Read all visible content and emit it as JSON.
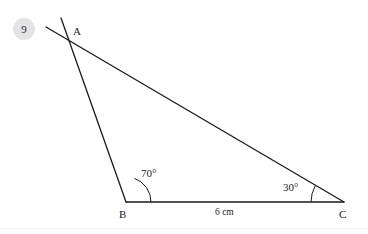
{
  "question": {
    "number": "9"
  },
  "figure": {
    "type": "triangle-geometry-diagram",
    "vertices": [
      {
        "name": "A",
        "label": "A",
        "x": 68,
        "y": 38
      },
      {
        "name": "B",
        "label": "B",
        "x": 126,
        "y": 202
      },
      {
        "name": "C",
        "label": "C",
        "x": 344,
        "y": 202
      }
    ],
    "angles": [
      {
        "at": "B",
        "label": "70°",
        "value": 70,
        "arc_radius": 25
      },
      {
        "at": "C",
        "label": "30°",
        "value": 30,
        "arc_radius": 33
      }
    ],
    "sides": [
      {
        "from": "B",
        "to": "C",
        "label": "6 cm",
        "length": 6,
        "unit": "cm"
      }
    ],
    "extensions": [
      {
        "line": "AB",
        "beyond": "A",
        "to_x": 61,
        "to_y": 18
      },
      {
        "line": "AC",
        "beyond": "A",
        "to_x": 46,
        "to_y": 27
      }
    ],
    "colors": {
      "stroke": "#1a1a1a",
      "badge_background": "#e4e4e7",
      "badge_text": "#2b2b2b",
      "page_background": "#ffffff",
      "rule": "#f2f2f3"
    }
  }
}
